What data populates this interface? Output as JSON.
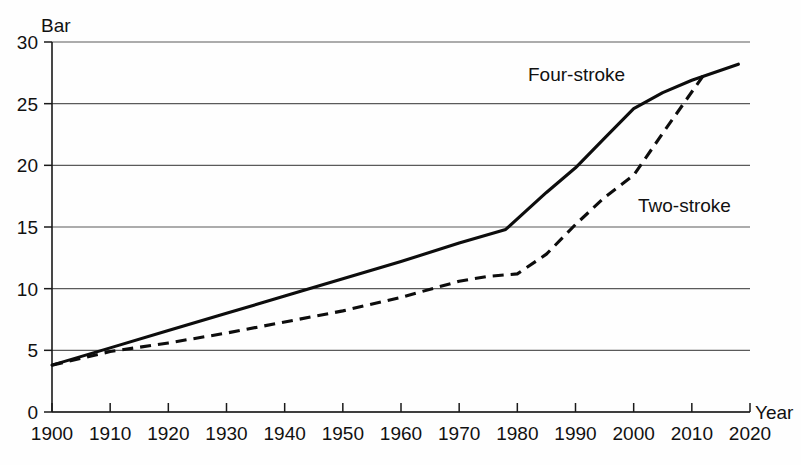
{
  "chart_data": {
    "type": "line",
    "title": "",
    "xlabel": "Year",
    "ylabel": "Bar",
    "xlim": [
      1900,
      2020
    ],
    "ylim": [
      0,
      30
    ],
    "grid": true,
    "legend_position": "inline-annotation",
    "x_ticks": [
      "1900",
      "1910",
      "1920",
      "1930",
      "1940",
      "1950",
      "1960",
      "1970",
      "1980",
      "1990",
      "2000",
      "2010",
      "2020"
    ],
    "y_ticks": [
      "0",
      "5",
      "10",
      "15",
      "20",
      "25",
      "30"
    ],
    "series": [
      {
        "name": "Four-stroke",
        "style": "solid",
        "x": [
          1900,
          1910,
          1920,
          1930,
          1940,
          1950,
          1960,
          1970,
          1978,
          1985,
          1990,
          1995,
          2000,
          2005,
          2010,
          2018
        ],
        "values": [
          3.8,
          5.2,
          6.6,
          8.0,
          9.4,
          10.8,
          12.2,
          13.7,
          14.8,
          17.8,
          19.8,
          22.2,
          24.6,
          25.9,
          26.9,
          28.2
        ]
      },
      {
        "name": "Two-stroke",
        "style": "dashed",
        "x": [
          1900,
          1910,
          1920,
          1930,
          1940,
          1950,
          1960,
          1970,
          1975,
          1980,
          1985,
          1990,
          1995,
          2000,
          2005,
          2012
        ],
        "values": [
          3.8,
          4.9,
          5.6,
          6.4,
          7.3,
          8.2,
          9.3,
          10.6,
          11.0,
          11.2,
          12.8,
          15.2,
          17.4,
          19.2,
          22.6,
          27.3
        ]
      }
    ]
  },
  "labels": {
    "y_axis_unit": "Bar",
    "x_axis_unit": "Year",
    "series_four_stroke": "Four-stroke",
    "series_two_stroke": "Two-stroke"
  },
  "colors": {
    "line": "#0d0d0d",
    "grid": "#5a5a5a",
    "axis": "#1a1a1a",
    "background": "#fefefe"
  }
}
